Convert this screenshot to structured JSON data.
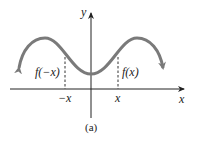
{
  "figure": {
    "caption": "(a)",
    "axes": {
      "x_label": "x",
      "y_label": "y"
    },
    "ticks": {
      "neg_x": "−x",
      "pos_x": "x"
    },
    "annotations": {
      "left": "f(−x)",
      "right": "f(x)"
    },
    "colors": {
      "curve": "#7a7a7a",
      "axes": "#222222",
      "dashed": "#333333"
    }
  }
}
